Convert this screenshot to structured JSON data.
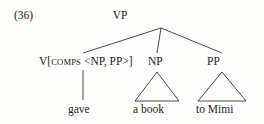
{
  "figure": {
    "example_number": "(36)",
    "type": "syntax-tree",
    "ink_color": "#1c1c1c",
    "background_color": "#fdfdfc"
  },
  "tree": {
    "root": {
      "label": "VP"
    },
    "daughters": [
      {
        "label_prefix": "V[",
        "label_feature": "COMPS",
        "label_suffix": " <NP, PP>]",
        "label_full": "V[COMPS <NP, PP>]",
        "terminal": "gave",
        "triangle": false
      },
      {
        "label_full": "NP",
        "terminal": "a book",
        "triangle": true
      },
      {
        "label_full": "PP",
        "terminal": "to Mimi",
        "triangle": true
      }
    ]
  }
}
